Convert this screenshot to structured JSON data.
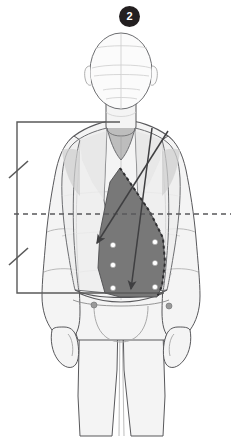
{
  "figure": {
    "step_badge": {
      "label": "2",
      "background_color": "#231f20",
      "text_color": "#ffffff"
    },
    "view": "front",
    "colors": {
      "background": "#ffffff",
      "body_fill": "#f4f4f4",
      "body_outline": "#58585b",
      "body_detail_line": "#bcbcbc",
      "garment_fill": "#ededed",
      "garment_outline": "#6d6e71",
      "pattern_panel_fill": "#787878",
      "pattern_panel_outline": "#4d4d4f",
      "bracket_line": "#595959",
      "dashed_line": "#58585b",
      "arrow_line": "#3f3f41",
      "button_fill": "#ffffff",
      "button_outline": "#9a9a9a",
      "hip_button_fill": "#9a9a9a"
    },
    "annotations": {
      "measurement_bracket": {
        "name": "left-measurement-bracket",
        "orientation": "vertical",
        "x": 17,
        "top_y": 122,
        "bottom_y": 293,
        "top_arm_end_x": 120,
        "bottom_arm_end_x": 164,
        "tick_marks": [
          {
            "name": "upper-tick",
            "y": 170
          },
          {
            "name": "lower-tick",
            "y": 257
          }
        ]
      },
      "waistline": {
        "name": "dashed-waist-guideline",
        "style": "dashed",
        "y": 214,
        "x_start": 14,
        "x_end": 231
      },
      "arrows": [
        {
          "name": "arrow-upper-left-diagonal",
          "from": [
            168,
            131
          ],
          "to": [
            96,
            244
          ],
          "direction": "down-left"
        },
        {
          "name": "arrow-lower-left-diagonal",
          "from": [
            152,
            128
          ],
          "to": [
            131,
            290
          ],
          "direction": "down"
        }
      ],
      "pattern_panel": {
        "name": "shaded-front-pattern-panel",
        "edge_style_right": "dashed-stitch",
        "button_rows": 3,
        "button_columns": 2,
        "button_positions": [
          [
            113,
            245
          ],
          [
            155,
            242
          ],
          [
            113,
            265
          ],
          [
            155,
            263
          ],
          [
            113,
            288
          ],
          [
            155,
            287
          ]
        ]
      },
      "hip_buttons": [
        {
          "name": "hip-button-left",
          "cx": 94,
          "cy": 305
        },
        {
          "name": "hip-button-right",
          "cx": 169,
          "cy": 306
        }
      ]
    }
  }
}
